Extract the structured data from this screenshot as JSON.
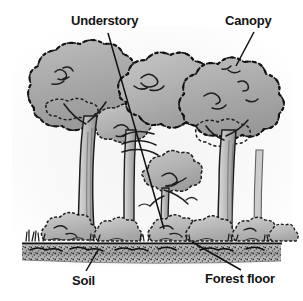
{
  "figure": {
    "type": "labeled-illustration",
    "background_color": "#ffffff",
    "ink_color": "#141414",
    "wash_color": "#a9a9a9",
    "width": 303,
    "height": 301
  },
  "labels": {
    "understory": "Understory",
    "canopy": "Canopy",
    "soil": "Soil",
    "forest_floor": "Forest floor"
  },
  "leader_lines": [
    {
      "name": "understory-leader",
      "x1": 108,
      "y1": 33,
      "x2": 164,
      "y2": 229
    },
    {
      "name": "canopy-leader",
      "x1": 254,
      "y1": 32,
      "x2": 236,
      "y2": 66
    },
    {
      "name": "soil-leader",
      "x1": 98,
      "y1": 250,
      "x2": 86,
      "y2": 271
    },
    {
      "name": "forest-floor-leader",
      "x1": 192,
      "y1": 242,
      "x2": 241,
      "y2": 270
    }
  ],
  "scene": {
    "ground_line_y": 243,
    "soil_band": {
      "top": 245,
      "bottom": 262
    },
    "layers": [
      {
        "name": "canopy",
        "description": "upper tree crowns"
      },
      {
        "name": "understory",
        "description": "small trees and saplings below the canopy"
      },
      {
        "name": "forest-floor",
        "description": "shrubs, grass and litter at ground level"
      },
      {
        "name": "soil",
        "description": "stippled dark band beneath the ground line"
      }
    ],
    "trees": [
      {
        "name": "tree-left",
        "trunk_x": 78,
        "crown_cx": 80,
        "crown_cy": 95
      },
      {
        "name": "tree-middle",
        "trunk_x": 130,
        "crown_cx": 150,
        "crown_cy": 85
      },
      {
        "name": "tree-right",
        "trunk_x": 225,
        "crown_cx": 230,
        "crown_cy": 100
      },
      {
        "name": "sapling-understory",
        "trunk_x": 160,
        "crown_cx": 172,
        "crown_cy": 175
      }
    ]
  }
}
